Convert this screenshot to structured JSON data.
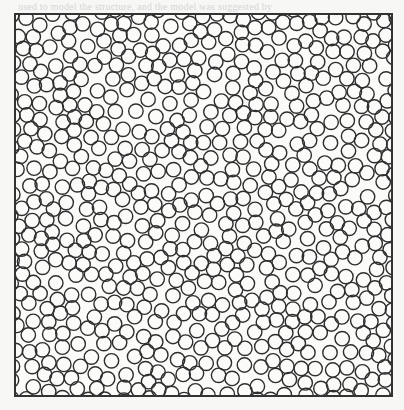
{
  "page": {
    "background": "#f7f7f6",
    "bleed_text_top": "used to model the structure, and the model was suggested by",
    "bleed_text_bottom": ""
  },
  "figure": {
    "frame": {
      "x": 15,
      "y": 14,
      "width": 377,
      "height": 382,
      "stroke": "#333333",
      "stroke_width": 2
    },
    "disks": {
      "count": 640,
      "radius": 7.2,
      "stroke": "#2e2e2e",
      "stroke_width": 1.4,
      "fill": "none",
      "min_center_distance": 12.4,
      "seed": 20240611
    }
  }
}
